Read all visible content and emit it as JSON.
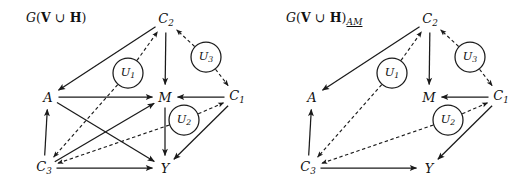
{
  "figure": {
    "width": 528,
    "height": 186,
    "background": "#ffffff",
    "ink_color": "#1a1a1a"
  },
  "panels": [
    {
      "id": "left",
      "title_prefix": "(",
      "title_script": "G",
      "title_set_v": "V",
      "title_union": " ∪ ",
      "title_set_h": "H",
      "title_close": ")",
      "title_subscript": "",
      "title_plain": "G(V ∪ H)",
      "nodes": [
        {
          "id": "A",
          "label": "A",
          "sub": "",
          "x": 48,
          "y": 97
        },
        {
          "id": "M",
          "label": "M",
          "sub": "",
          "x": 165,
          "y": 97
        },
        {
          "id": "Y",
          "label": "Y",
          "sub": "",
          "x": 165,
          "y": 168
        },
        {
          "id": "C1",
          "label": "C",
          "sub": "1",
          "x": 237,
          "y": 97
        },
        {
          "id": "C2",
          "label": "C",
          "sub": "2",
          "x": 166,
          "y": 20
        },
        {
          "id": "C3",
          "label": "C",
          "sub": "3",
          "x": 44,
          "y": 168
        }
      ],
      "latents": [
        {
          "id": "U1",
          "label": "U",
          "sub": "1",
          "x": 128,
          "y": 73,
          "r": 15
        },
        {
          "id": "U2",
          "label": "U",
          "sub": "2",
          "x": 184,
          "y": 120,
          "r": 15
        },
        {
          "id": "U3",
          "label": "U",
          "sub": "3",
          "x": 206,
          "y": 57,
          "r": 15
        }
      ],
      "edges": [
        {
          "from": "C2",
          "to": "A",
          "style": "solid",
          "kind": "directed"
        },
        {
          "from": "C2",
          "to": "M",
          "style": "solid",
          "kind": "directed"
        },
        {
          "from": "A",
          "to": "M",
          "style": "solid",
          "kind": "directed"
        },
        {
          "from": "A",
          "to": "Y",
          "style": "solid",
          "kind": "directed"
        },
        {
          "from": "M",
          "to": "Y",
          "style": "solid",
          "kind": "directed"
        },
        {
          "from": "C1",
          "to": "M",
          "style": "solid",
          "kind": "directed"
        },
        {
          "from": "C1",
          "to": "Y",
          "style": "solid",
          "kind": "directed"
        },
        {
          "from": "C3",
          "to": "A",
          "style": "solid",
          "kind": "directed"
        },
        {
          "from": "C3",
          "to": "M",
          "style": "solid",
          "kind": "directed"
        },
        {
          "from": "C3",
          "to": "Y",
          "style": "solid",
          "kind": "directed"
        },
        {
          "from": "U1",
          "to": "C2",
          "style": "dashed",
          "kind": "directed"
        },
        {
          "from": "U1",
          "to": "C3",
          "style": "dashed",
          "kind": "directed"
        },
        {
          "from": "U2",
          "to": "C1",
          "style": "dashed",
          "kind": "directed"
        },
        {
          "from": "U2",
          "to": "C3",
          "style": "dashed",
          "kind": "directed"
        },
        {
          "from": "U3",
          "to": "C2",
          "style": "dashed",
          "kind": "directed"
        },
        {
          "from": "U3",
          "to": "C1",
          "style": "dashed",
          "kind": "directed"
        }
      ]
    },
    {
      "id": "right",
      "title_prefix": "(",
      "title_script": "G",
      "title_set_v": "V",
      "title_union": " ∪ ",
      "title_set_h": "H",
      "title_close": ")",
      "title_subscript": "AM",
      "title_plain": "G(V ∪ H)AM",
      "nodes": [
        {
          "id": "A",
          "label": "A",
          "sub": "",
          "x": 48,
          "y": 97
        },
        {
          "id": "M",
          "label": "M",
          "sub": "",
          "x": 165,
          "y": 97
        },
        {
          "id": "Y",
          "label": "Y",
          "sub": "",
          "x": 165,
          "y": 168
        },
        {
          "id": "C1",
          "label": "C",
          "sub": "1",
          "x": 237,
          "y": 97
        },
        {
          "id": "C2",
          "label": "C",
          "sub": "2",
          "x": 166,
          "y": 20
        },
        {
          "id": "C3",
          "label": "C",
          "sub": "3",
          "x": 44,
          "y": 168
        }
      ],
      "latents": [
        {
          "id": "U1",
          "label": "U",
          "sub": "1",
          "x": 128,
          "y": 73,
          "r": 15
        },
        {
          "id": "U2",
          "label": "U",
          "sub": "2",
          "x": 184,
          "y": 120,
          "r": 15
        },
        {
          "id": "U3",
          "label": "U",
          "sub": "3",
          "x": 206,
          "y": 57,
          "r": 15
        }
      ],
      "edges": [
        {
          "from": "C2",
          "to": "A",
          "style": "solid",
          "kind": "directed"
        },
        {
          "from": "C2",
          "to": "M",
          "style": "solid",
          "kind": "directed"
        },
        {
          "from": "C1",
          "to": "M",
          "style": "solid",
          "kind": "directed"
        },
        {
          "from": "C1",
          "to": "Y",
          "style": "solid",
          "kind": "directed"
        },
        {
          "from": "C3",
          "to": "A",
          "style": "solid",
          "kind": "directed"
        },
        {
          "from": "C3",
          "to": "Y",
          "style": "solid",
          "kind": "directed"
        },
        {
          "from": "U1",
          "to": "C2",
          "style": "dashed",
          "kind": "directed"
        },
        {
          "from": "U1",
          "to": "C3",
          "style": "dashed",
          "kind": "directed"
        },
        {
          "from": "U2",
          "to": "C1",
          "style": "dashed",
          "kind": "directed"
        },
        {
          "from": "U2",
          "to": "C3",
          "style": "dashed",
          "kind": "directed"
        },
        {
          "from": "U3",
          "to": "C2",
          "style": "dashed",
          "kind": "directed"
        },
        {
          "from": "U3",
          "to": "C1",
          "style": "dashed",
          "kind": "directed"
        }
      ]
    }
  ]
}
